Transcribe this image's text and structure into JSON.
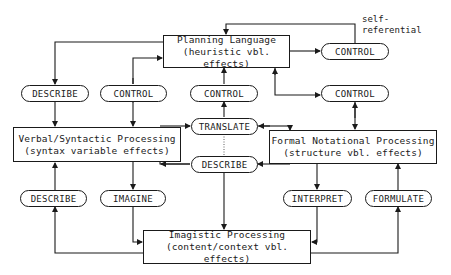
{
  "diagram": {
    "boxes": {
      "planning": {
        "title": "Planning Language",
        "subtitle": "(heuristic vbl. effects)"
      },
      "verbal": {
        "title": "Verbal/Syntactic Processing",
        "subtitle": "(syntax variable effects)"
      },
      "formal": {
        "title": "Formal Notational Processing",
        "subtitle": "(structure vbl. effects)"
      },
      "imagistic": {
        "title": "Imagistic Processing",
        "subtitle": "(content/context vbl. effects)"
      }
    },
    "pills": {
      "control_self": "CONTROL",
      "describe_planning": "DESCRIBE",
      "control_verbal": "CONTROL",
      "control_translate": "CONTROL",
      "control_formal": "CONTROL",
      "translate": "TRANSLATE",
      "describe_center": "DESCRIBE",
      "describe_imagistic": "DESCRIBE",
      "imagine": "IMAGINE",
      "interpret": "INTERPRET",
      "formulate": "FORMULATE"
    },
    "annotations": {
      "self_referential_line1": "self-",
      "self_referential_line2": "referential"
    },
    "colors": {
      "line": "#1a1a1a",
      "background": "#ffffff"
    }
  }
}
